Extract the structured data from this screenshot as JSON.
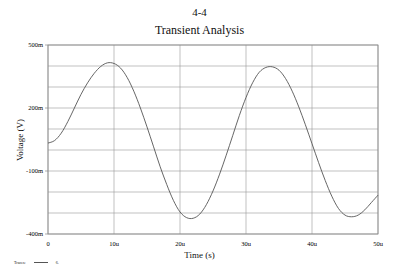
{
  "page": {
    "label": "4-4"
  },
  "legend": {
    "title": "Traces:",
    "entries": [
      {
        "label": "6.",
        "color": "#555555"
      }
    ]
  },
  "chart_data": {
    "type": "line",
    "title": "Transient Analysis",
    "xlabel": "Time (s)",
    "ylabel": "Voltage (V)",
    "xlim": [
      0,
      50
    ],
    "ylim": [
      -400,
      500
    ],
    "x_unit": "us",
    "y_unit": "mV",
    "x_ticks": [
      0,
      10,
      20,
      30,
      40,
      50
    ],
    "x_tick_labels": [
      "0",
      "10u",
      "20u",
      "30u",
      "40u",
      "50u"
    ],
    "y_ticks": [
      500,
      200,
      -100,
      -400
    ],
    "y_tick_labels": [
      "500m",
      "200m",
      "-100m",
      "-400m"
    ],
    "y_gridlines": [
      500,
      400,
      300,
      200,
      100,
      0,
      -100,
      -200,
      -300,
      -400
    ],
    "grid": true,
    "legend_position": "bottom-left",
    "series": [
      {
        "name": "6.",
        "color": "#555555",
        "x": [
          0,
          1,
          2,
          3,
          4,
          5,
          6,
          7,
          8,
          9,
          10,
          11,
          12,
          13,
          14,
          15,
          16,
          17,
          18,
          19,
          20,
          21,
          22,
          23,
          24,
          25,
          26,
          27,
          28,
          29,
          30,
          31,
          32,
          33,
          34,
          35,
          36,
          37,
          38,
          39,
          40,
          41,
          42,
          43,
          44,
          45,
          46,
          47,
          48,
          49,
          50
        ],
        "values": [
          33,
          45,
          80,
          135,
          200,
          265,
          320,
          365,
          398,
          415,
          412,
          390,
          345,
          280,
          200,
          110,
          15,
          -80,
          -165,
          -240,
          -295,
          -322,
          -325,
          -305,
          -260,
          -195,
          -115,
          -25,
          70,
          165,
          250,
          320,
          370,
          393,
          396,
          380,
          340,
          280,
          205,
          120,
          30,
          -60,
          -145,
          -220,
          -278,
          -310,
          -318,
          -310,
          -285,
          -250,
          -215
        ]
      }
    ]
  }
}
